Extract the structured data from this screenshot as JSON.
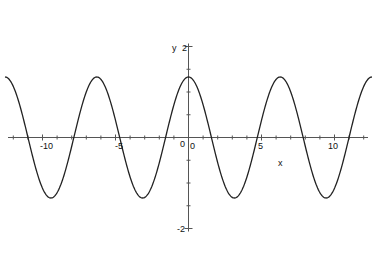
{
  "chart_data": {
    "type": "line",
    "title": "",
    "xlabel": "x",
    "ylabel": "y",
    "function": "y = 1.33*cos(x)",
    "xlim": [
      -12.57,
      12.57
    ],
    "ylim": [
      -2,
      2
    ],
    "x_ticks_labeled": [
      -10,
      -5,
      0,
      5,
      10
    ],
    "x_tick_labels": [
      "-10",
      "-5",
      "0",
      "5",
      "10"
    ],
    "y_ticks_labeled": [
      2,
      -2
    ],
    "y_tick_labels": [
      "2",
      "-2"
    ],
    "origin_label": "0",
    "grid": false,
    "legend": "none",
    "series": [
      {
        "name": "curve",
        "color": "#222222",
        "amplitude": 1.33,
        "period": 6.283,
        "peaks_x": [
          -12.57,
          -6.28,
          0,
          6.28,
          12.57
        ],
        "troughs_x": [
          -9.42,
          -3.14,
          3.14,
          9.42
        ],
        "zeros_x": [
          -10.99,
          -7.85,
          -4.71,
          -1.57,
          1.57,
          4.71,
          7.85,
          10.99
        ]
      }
    ]
  },
  "labels": {
    "x_axis": "x",
    "y_axis": "y",
    "origin_x": "0",
    "origin_y": "0",
    "x_neg10": "-10",
    "x_neg5": "-5",
    "x_5": "5",
    "x_10": "10",
    "y_2": "2",
    "y_neg2": "-2"
  }
}
